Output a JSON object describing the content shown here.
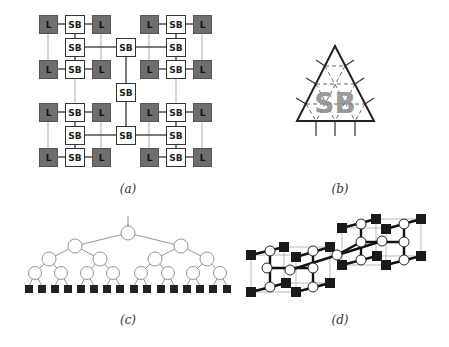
{
  "figure": {
    "panels": [
      {
        "id": "a",
        "caption": "(a)",
        "description": "Hierarchical SB/L mesh"
      },
      {
        "id": "b",
        "caption": "(b)",
        "description": "Triangular SB element"
      },
      {
        "id": "c",
        "caption": "(c)",
        "description": "Binary tree with 16 leaves"
      },
      {
        "id": "d",
        "caption": "(d)",
        "description": "3D cube interconnect"
      }
    ],
    "labels": {
      "sb": "SB",
      "l": "L"
    },
    "colors": {
      "l_fill": "#6e6e6e",
      "sb_fill": "#ffffff",
      "stroke": "#333333",
      "gray_line": "#bbbbbb",
      "leaf_fill": "#222222"
    }
  }
}
